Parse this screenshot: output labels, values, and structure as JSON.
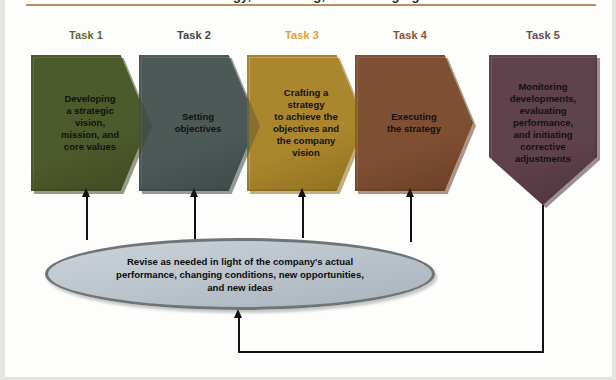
{
  "figure": {
    "title_cropped": "strategy, evaluating, and managing",
    "accent_rule_color": "#c08a63"
  },
  "tasks": [
    {
      "label": "Task 1",
      "label_color": "#5d6b32",
      "text": "Developing\na strategic\nvision,\nmission, and\ncore values",
      "fill": "#5e6d36",
      "shade": "#3f4a22",
      "shape": "chevron"
    },
    {
      "label": "Task 2",
      "label_color": "#3f4547",
      "text": "Setting\nobjectives",
      "fill": "#5f6d6c",
      "shade": "#3e4847",
      "shape": "chevron"
    },
    {
      "label": "Task 3",
      "label_color": "#dfa233",
      "text": "Crafting a\nstrategy\nto achieve the\nobjectives and\nthe company\nvision",
      "fill": "#c9a23f",
      "shade": "#90701f",
      "shape": "chevron"
    },
    {
      "label": "Task 4",
      "label_color": "#8a5338",
      "text": "Executing\nthe strategy",
      "fill": "#9a6244",
      "shade": "#6a3f27",
      "shape": "chevron"
    },
    {
      "label": "Task 5",
      "label_color": "#6b4a56",
      "text": "Monitoring\ndevelopments,\nevaluating\nperformance,\nand initiating\ncorrective\nadjustments",
      "fill": "#77545f",
      "shade": "#4d333c",
      "shape": "banner"
    }
  ],
  "revise_ellipse": {
    "text": "Revise as needed in light of the company's actual\nperformance, changing conditions, new opportunities,\nand new ideas",
    "fill": "#bcc5cd",
    "stroke": "#6e7478"
  },
  "connectors": {
    "feedback_label": "feedback loop from Task 5 to revise ellipse",
    "arrow_color": "#121212"
  }
}
